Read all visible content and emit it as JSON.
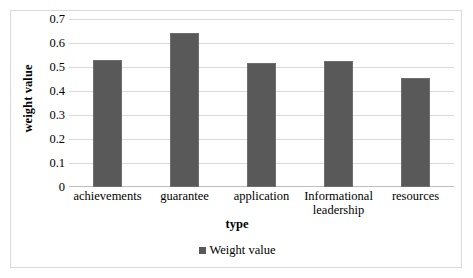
{
  "chart_data": {
    "type": "bar",
    "title": "",
    "subtitle": "",
    "xlabel": "type",
    "ylabel": "weight value",
    "categories": [
      "achievements",
      "guarantee",
      "application",
      "Informational leadership",
      "resources"
    ],
    "values": [
      0.53,
      0.64,
      0.515,
      0.525,
      0.455
    ],
    "series": [
      {
        "name": "Weight value",
        "values": [
          0.53,
          0.64,
          0.515,
          0.525,
          0.455
        ]
      }
    ],
    "ylim": [
      0,
      0.7
    ],
    "ytick_labels": [
      "0.7",
      "0.6",
      "0.5",
      "0.4",
      "0.3",
      "0.2",
      "0.1",
      "0"
    ],
    "ytick_values": [
      0.7,
      0.6,
      0.5,
      0.4,
      0.3,
      0.2,
      0.1,
      0
    ],
    "grid": true,
    "grid_axis": "y",
    "legend": {
      "position": "bottom",
      "entries": [
        {
          "label": "Weight value",
          "marker": "square-marker",
          "color": "#595959"
        }
      ]
    },
    "colors": {
      "bar_fill": "#595959",
      "bar_stroke": "#6e6e6e",
      "gridline": "#d9d9d9",
      "axis": "#bfbfbf",
      "frame_border": "#d9d9d9",
      "background": "#ffffff",
      "text": "#000000"
    }
  }
}
